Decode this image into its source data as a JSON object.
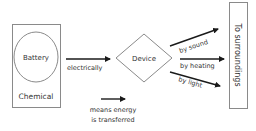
{
  "diagram": {
    "source": {
      "title": "Battery",
      "store": "Chemical"
    },
    "input_transfer": {
      "label": "electrically"
    },
    "device": {
      "label": "Device"
    },
    "outputs": [
      {
        "label": "by sound"
      },
      {
        "label": "by heating"
      },
      {
        "label": "by light"
      }
    ],
    "destination": {
      "label": "To surroundings"
    },
    "legend": {
      "line1": "means energy",
      "line2": "is transferred"
    },
    "colors": {
      "stroke": "#8a8a8a",
      "arrow": "#1a1a1a",
      "text": "#333333",
      "background": "#ffffff"
    }
  }
}
